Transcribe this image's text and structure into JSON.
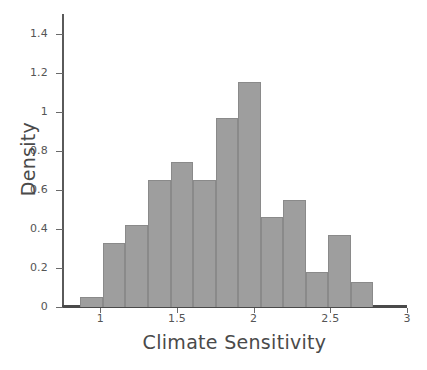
{
  "chart_data": {
    "type": "bar",
    "title": "",
    "subtitle": "",
    "xlabel": "Climate Sensitivity",
    "ylabel": "Density",
    "xlim": [
      0.75,
      3.0
    ],
    "ylim": [
      0,
      1.5
    ],
    "xticks": [
      "1",
      "1.5",
      "2",
      "2.5",
      "3"
    ],
    "xtick_values": [
      1,
      1.5,
      2,
      2.5,
      3
    ],
    "yticks": [
      "0",
      "0.2",
      "0.4",
      "0.6",
      "0.8",
      "1",
      "1.2",
      "1.4"
    ],
    "ytick_values": [
      0,
      0.2,
      0.4,
      0.6,
      0.8,
      1.0,
      1.2,
      1.4
    ],
    "grid": false,
    "legend": false,
    "bin_width": 0.147,
    "bin_edges": [
      0.87,
      1.017,
      1.164,
      1.311,
      1.458,
      1.605,
      1.752,
      1.899,
      2.046,
      2.193,
      2.34,
      2.487,
      2.634,
      2.781
    ],
    "bin_centers": [
      0.944,
      1.091,
      1.238,
      1.385,
      1.532,
      1.679,
      1.826,
      1.973,
      2.12,
      2.267,
      2.414,
      2.561,
      2.708
    ],
    "values": [
      0.05,
      0.33,
      0.42,
      0.65,
      0.74,
      0.65,
      0.97,
      1.15,
      0.46,
      0.55,
      0.18,
      0.37,
      0.13
    ],
    "colors": {
      "bar_fill": "#9e9e9e",
      "bar_edge": "#8a8a8a",
      "axis": "#4a4a4a",
      "text": "#4a4a4a",
      "background": "#ffffff"
    }
  }
}
